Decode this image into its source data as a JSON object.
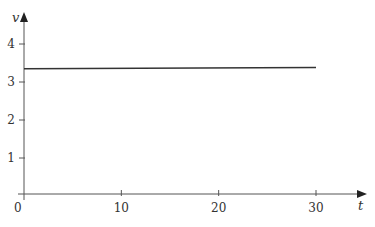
{
  "chart_data": {
    "type": "line",
    "title": "",
    "xlabel": "t",
    "ylabel": "v",
    "xlim": [
      0,
      30
    ],
    "ylim": [
      0,
      4
    ],
    "xticks": [
      0,
      10,
      20,
      30
    ],
    "yticks": [
      1,
      2,
      3,
      4
    ],
    "xtick_labels": [
      "0",
      "10",
      "20",
      "30"
    ],
    "ytick_labels": [
      "1",
      "2",
      "3",
      "4"
    ],
    "grid": false,
    "legend": null,
    "series": [
      {
        "name": "v(t)",
        "x": [
          0,
          30
        ],
        "y": [
          3.35,
          3.38
        ],
        "color": "#333333"
      }
    ]
  },
  "axes": {
    "origin_label": "0",
    "x_label": "t",
    "y_label": "v"
  },
  "colors": {
    "axis": "#555555",
    "line": "#333333"
  }
}
